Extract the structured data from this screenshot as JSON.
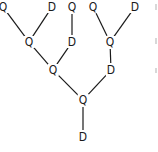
{
  "diagram": {
    "type": "tree",
    "line_color": "#1a1a1a",
    "nodes": [
      {
        "id": "q1",
        "label": "Q",
        "x": 3,
        "y": 7
      },
      {
        "id": "d1",
        "label": "D",
        "x": 52,
        "y": 7
      },
      {
        "id": "q2",
        "label": "Q",
        "x": 72,
        "y": 7
      },
      {
        "id": "q3",
        "label": "Q",
        "x": 93,
        "y": 7
      },
      {
        "id": "d2",
        "label": "D",
        "x": 135,
        "y": 7
      },
      {
        "id": "q4",
        "label": "Q",
        "x": 29,
        "y": 42
      },
      {
        "id": "d3",
        "label": "D",
        "x": 72,
        "y": 42
      },
      {
        "id": "q5",
        "label": "Q",
        "x": 110,
        "y": 42
      },
      {
        "id": "q6",
        "label": "Q",
        "x": 53,
        "y": 70
      },
      {
        "id": "d4",
        "label": "D",
        "x": 111,
        "y": 70
      },
      {
        "id": "q7",
        "label": "Q",
        "x": 83,
        "y": 100
      },
      {
        "id": "d5",
        "label": "D",
        "x": 83,
        "y": 137
      }
    ],
    "edges": [
      [
        "q1",
        "q4"
      ],
      [
        "d1",
        "q4"
      ],
      [
        "q2",
        "d3"
      ],
      [
        "q3",
        "q5"
      ],
      [
        "d2",
        "q5"
      ],
      [
        "q4",
        "q6"
      ],
      [
        "d3",
        "q6"
      ],
      [
        "q5",
        "d4"
      ],
      [
        "q6",
        "q7"
      ],
      [
        "d4",
        "q7"
      ],
      [
        "q7",
        "d5"
      ]
    ]
  }
}
